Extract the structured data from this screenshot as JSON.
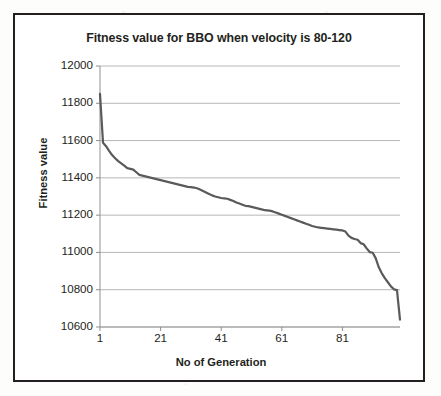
{
  "chart_data": {
    "type": "line",
    "title": "Fitness value for BBO when velocity is 80-120",
    "xlabel": "No of Generation",
    "ylabel": "Fitness value",
    "xlim": [
      1,
      100
    ],
    "ylim": [
      10600,
      12000
    ],
    "ytick_labels": [
      "12000",
      "11800",
      "11600",
      "11400",
      "11200",
      "11000",
      "10800",
      "10600"
    ],
    "ytick_values": [
      12000,
      11800,
      11600,
      11400,
      11200,
      11000,
      10800,
      10600
    ],
    "xtick_labels": [
      "1",
      "21",
      "41",
      "61",
      "81"
    ],
    "xtick_values": [
      1,
      21,
      41,
      61,
      81
    ],
    "grid": "horizontal",
    "legend": null,
    "line_color": "#5a5a5a",
    "line_width": 2.2,
    "series": [
      {
        "name": "BBO fitness",
        "x": [
          1,
          2,
          3,
          4,
          5,
          6,
          7,
          8,
          9,
          10,
          11,
          12,
          13,
          14,
          15,
          16,
          17,
          18,
          19,
          20,
          21,
          22,
          23,
          24,
          25,
          26,
          27,
          28,
          29,
          30,
          31,
          32,
          33,
          34,
          35,
          36,
          37,
          38,
          39,
          40,
          41,
          42,
          43,
          44,
          45,
          46,
          47,
          48,
          49,
          50,
          51,
          52,
          53,
          54,
          55,
          56,
          57,
          58,
          59,
          60,
          61,
          62,
          63,
          64,
          65,
          66,
          67,
          68,
          69,
          70,
          71,
          72,
          73,
          74,
          75,
          76,
          77,
          78,
          79,
          80,
          81,
          82,
          83,
          84,
          85,
          86,
          87,
          88,
          89,
          90,
          91,
          92,
          93,
          94,
          95,
          96,
          97,
          98,
          99,
          100
        ],
        "values": [
          11850,
          11588,
          11570,
          11545,
          11522,
          11505,
          11490,
          11478,
          11466,
          11452,
          11448,
          11444,
          11430,
          11416,
          11412,
          11408,
          11404,
          11400,
          11396,
          11392,
          11388,
          11384,
          11380,
          11376,
          11372,
          11368,
          11364,
          11360,
          11356,
          11352,
          11350,
          11348,
          11344,
          11338,
          11330,
          11322,
          11314,
          11306,
          11300,
          11296,
          11292,
          11290,
          11288,
          11282,
          11276,
          11268,
          11262,
          11256,
          11250,
          11248,
          11244,
          11240,
          11236,
          11232,
          11228,
          11226,
          11224,
          11220,
          11214,
          11208,
          11202,
          11196,
          11190,
          11184,
          11178,
          11172,
          11166,
          11160,
          11154,
          11148,
          11142,
          11138,
          11134,
          11132,
          11130,
          11128,
          11126,
          11124,
          11122,
          11120,
          11118,
          11112,
          11090,
          11078,
          11072,
          11068,
          11050,
          11044,
          11022,
          11002,
          10998,
          10968,
          10920,
          10888,
          10862,
          10840,
          10818,
          10802,
          10798,
          10640
        ]
      }
    ]
  }
}
